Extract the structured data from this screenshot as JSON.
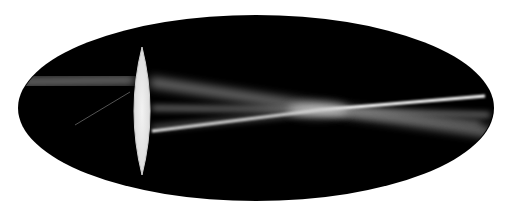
{
  "scene": {
    "description": "Photograph of a convex lens focusing light beams inside a dark elliptical region",
    "background_color": "#ffffff",
    "ellipse_color": "#000000",
    "lens_color": "#e6e6e6",
    "beam_color": "#ffffff"
  }
}
